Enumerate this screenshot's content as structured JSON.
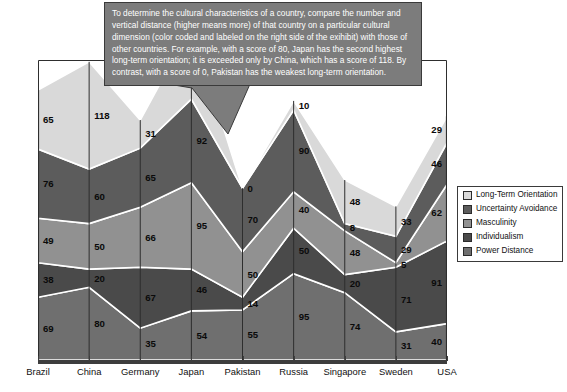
{
  "callout": {
    "text": "To determine the cultural characteristics of a country, compare the number and vertical distance (higher means more) of that country on a particular cultural dimension (color coded and labeled on the right side of the exihibit) with those of other countries.  For example, with a score of 80, Japan has the second highest long-term orientation; it is exceeded only by China, which has a score of 118.  By contrast, with a score of 0, Pakistan has the weakest long-term orientation."
  },
  "legend": {
    "position": "right",
    "items": [
      {
        "label": "Long-Term Orientation",
        "color": "#d9d9d9"
      },
      {
        "label": "Uncertainty Avoidance",
        "color": "#5c5c5c"
      },
      {
        "label": "Masculinity",
        "color": "#919191"
      },
      {
        "label": "Individualism",
        "color": "#4a4a4a"
      },
      {
        "label": "Power Distance",
        "color": "#6f6f6f"
      }
    ]
  },
  "chart_data": {
    "type": "area",
    "title": "",
    "xlabel": "",
    "ylabel": "",
    "stacked": true,
    "grid": false,
    "legend_position": "right",
    "ylim": [
      0,
      330
    ],
    "categories": [
      "Brazil",
      "China",
      "Germany",
      "Japan",
      "Pakistan",
      "Russia",
      "Singapore",
      "Sweden",
      "USA"
    ],
    "series": [
      {
        "name": "Power Distance",
        "color": "#6f6f6f",
        "values": [
          69,
          80,
          35,
          54,
          55,
          95,
          74,
          31,
          40
        ]
      },
      {
        "name": "Individualism",
        "color": "#4a4a4a",
        "values": [
          38,
          20,
          67,
          46,
          14,
          50,
          20,
          71,
          91
        ]
      },
      {
        "name": "Masculinity",
        "color": "#919191",
        "values": [
          49,
          50,
          66,
          95,
          50,
          40,
          48,
          5,
          62
        ]
      },
      {
        "name": "Uncertainty Avoidance",
        "color": "#5c5c5c",
        "values": [
          76,
          60,
          65,
          92,
          70,
          90,
          8,
          29,
          46
        ]
      },
      {
        "name": "Long-Term Orientation",
        "color": "#d9d9d9",
        "values": [
          65,
          118,
          31,
          80,
          0,
          10,
          48,
          33,
          29
        ]
      }
    ]
  }
}
